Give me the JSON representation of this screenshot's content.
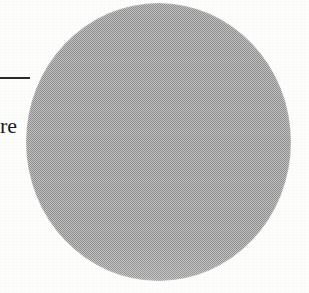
{
  "page": {
    "kind": "scanned-document-fragment",
    "background_color": "#fdfdfc",
    "width_px": 309,
    "height_px": 293
  },
  "figure": {
    "name": "halftone-circle",
    "shape": "circle",
    "fill_description": "halftone dithered gray",
    "fill_color": "#a3a3a3",
    "dither_light_color": "#c2c2c2",
    "dither_dark_color": "#8e8e8e",
    "left_px": 26,
    "top_px": 3,
    "width_px": 265,
    "height_px": 278
  },
  "rule": {
    "name": "horizontal-rule",
    "color": "#2b2b2b",
    "left_px": 0,
    "top_px": 77,
    "width_px": 30,
    "thickness_px": 2
  },
  "text": {
    "fragment": "re",
    "color": "#1d1d1d",
    "left_px": 0,
    "baseline_top_px": 114,
    "font_size_px": 22
  }
}
